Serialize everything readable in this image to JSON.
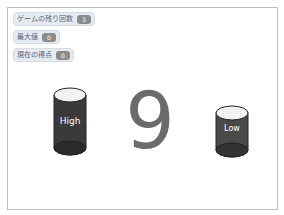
{
  "stage": {
    "monitors": [
      {
        "label": "ゲームの残り回数",
        "value": "3"
      },
      {
        "label": "最大値",
        "value": "0"
      },
      {
        "label": "現在の得点",
        "value": "0"
      }
    ],
    "high_button": {
      "label": "High",
      "icon": "cylinder-icon",
      "color": "#3a3a3a"
    },
    "low_button": {
      "label": "Low",
      "icon": "cylinder-icon",
      "color": "#4a4a4a"
    },
    "current_number": "9",
    "colors": {
      "digit": "#6b6b6b",
      "monitor_value_bg": "#8c8c8c",
      "monitor_bg": "#e6ebf2"
    }
  }
}
